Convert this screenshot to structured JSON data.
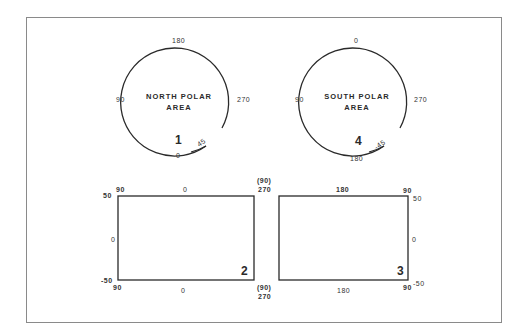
{
  "figure": {
    "colors": {
      "line": "#2a2a2a",
      "frame": "#8a8a8a",
      "background": "#ffffff"
    }
  },
  "panels": [
    {
      "id": 1,
      "number": "1",
      "type": "circle",
      "title_line1": "NORTH POLAR",
      "title_line2": "AREA",
      "labels": {
        "top": "180",
        "left": "90",
        "right": "270",
        "bottom": "0",
        "diag": "45"
      }
    },
    {
      "id": 4,
      "number": "4",
      "type": "circle",
      "title_line1": "SOUTH POLAR",
      "title_line2": "AREA",
      "labels": {
        "top": "0",
        "left": "90",
        "right": "270",
        "bottom": "180",
        "diag": "-45"
      }
    },
    {
      "id": 2,
      "number": "2",
      "type": "rectangle",
      "labels": {
        "top_left_lat": "50",
        "top_left_lon": "90",
        "top_center": "0",
        "mid_left": "0",
        "bottom_left_lat": "-50",
        "bottom_left_lon": "90",
        "bottom_center": "0",
        "top_right_paren": "(90)",
        "top_right": "270",
        "bottom_right_paren": "(90)",
        "bottom_right": "270"
      }
    },
    {
      "id": 3,
      "number": "3",
      "type": "rectangle",
      "labels": {
        "top_center": "180",
        "top_right_lon": "90",
        "top_right_lat": "50",
        "mid_right": "0",
        "bottom_center": "180",
        "bottom_right_lon": "90",
        "bottom_right_lat": "-50"
      }
    }
  ]
}
